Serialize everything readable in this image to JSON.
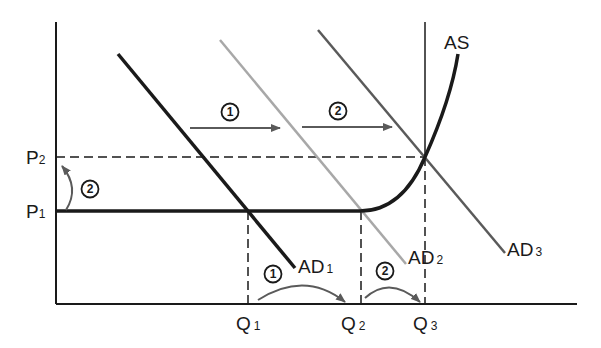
{
  "diagram": {
    "type": "AD-AS shift diagram",
    "axes": {
      "y_labels": [
        {
          "main": "P",
          "sub": "2"
        },
        {
          "main": "P",
          "sub": "1"
        }
      ],
      "x_labels": [
        {
          "main": "Q",
          "sub": "1"
        },
        {
          "main": "Q",
          "sub": "2"
        },
        {
          "main": "Q",
          "sub": "3"
        }
      ]
    },
    "curves": {
      "as_label": "AS",
      "ad": [
        {
          "main": "AD",
          "sub": "1",
          "color": "#1a1a1a"
        },
        {
          "main": "AD",
          "sub": "2",
          "color": "#a8a8a8"
        },
        {
          "main": "AD",
          "sub": "3",
          "color": "#5a5a5a"
        }
      ]
    },
    "step_markers": {
      "shift_1": "1",
      "shift_2": "2",
      "quantity_1": "1",
      "quantity_2": "2",
      "price_2": "2"
    },
    "colors": {
      "axis": "#1a1a1a",
      "arrow": "#5a5a5a",
      "dashed": "#1a1a1a"
    }
  }
}
